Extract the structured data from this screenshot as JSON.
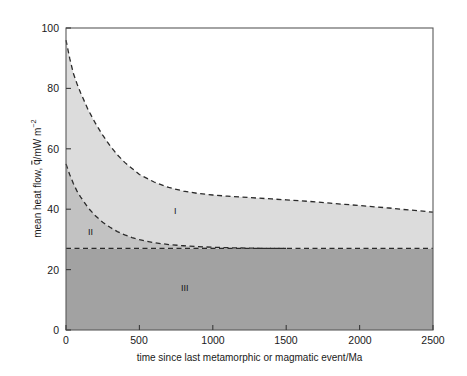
{
  "chart_data": {
    "type": "area",
    "title": "",
    "xlabel": "time since last metamorphic or magmatic event/Ma",
    "ylabel_parts": {
      "prefix": "mean heat flow, ",
      "symbol": "q",
      "suffix": "/mW m",
      "exponent": "−2"
    },
    "ylabel": "mean heat flow, q̄/mW m⁻²",
    "xlim": [
      0,
      2500
    ],
    "ylim": [
      0,
      100
    ],
    "xticks": [
      0,
      500,
      1000,
      1500,
      2000,
      2500
    ],
    "yticks": [
      0,
      20,
      40,
      60,
      80,
      100
    ],
    "xtick_labels": [
      "0",
      "500",
      "1000",
      "1500",
      "2000",
      "2500"
    ],
    "ytick_labels": [
      "0",
      "20",
      "40",
      "60",
      "80",
      "100"
    ],
    "grid": false,
    "legend": "none",
    "colors": {
      "region_I_fill": "#dcdcdc",
      "region_II_fill": "#c2c2c2",
      "region_III_fill": "#a2a2a2",
      "curve": "#2b2b2b",
      "axis": "#555555",
      "background": "#ffffff"
    },
    "series": [
      {
        "name": "upper bound (top of region I)",
        "style": "dashed",
        "x": [
          0,
          25,
          50,
          75,
          100,
          150,
          200,
          250,
          300,
          350,
          400,
          450,
          500,
          600,
          700,
          800,
          900,
          1000,
          1100,
          1200,
          1300,
          1400,
          1500,
          1600,
          1700,
          1800,
          1900,
          2000,
          2100,
          2200,
          2300,
          2400,
          2500
        ],
        "y": [
          96,
          90,
          85,
          81.5,
          78.5,
          73,
          68.5,
          64.5,
          61,
          58,
          55.5,
          53.5,
          51.5,
          49,
          47.2,
          46,
          45.2,
          44.7,
          44.3,
          44.0,
          43.7,
          43.4,
          43.1,
          42.8,
          42.4,
          42.0,
          41.6,
          41.2,
          40.8,
          40.4,
          39.9,
          39.5,
          39.0
        ]
      },
      {
        "name": "lower bound (boundary of regions II and I)",
        "style": "dashed",
        "x": [
          0,
          25,
          50,
          75,
          100,
          150,
          200,
          250,
          300,
          350,
          400,
          450,
          500,
          600,
          700,
          800,
          900,
          1000,
          1100,
          1200,
          1300,
          1400,
          1500
        ],
        "y": [
          55,
          51.5,
          48.5,
          46,
          44,
          40.5,
          37.8,
          35.7,
          34,
          32.6,
          31.5,
          30.6,
          29.9,
          28.9,
          28.3,
          27.9,
          27.6,
          27.4,
          27.25,
          27.15,
          27.08,
          27.03,
          27.0
        ]
      },
      {
        "name": "base line (top of region III)",
        "style": "dashed",
        "x": [
          0,
          2500
        ],
        "y": [
          27,
          27
        ]
      }
    ],
    "region_labels": [
      {
        "text": "I",
        "x": 760,
        "y": 38.5
      },
      {
        "text": "II",
        "x": 175,
        "y": 32.5
      },
      {
        "text": "III",
        "x": 820,
        "y": 14.0
      }
    ]
  },
  "regions": {
    "one": "I",
    "two": "II",
    "three": "III"
  }
}
